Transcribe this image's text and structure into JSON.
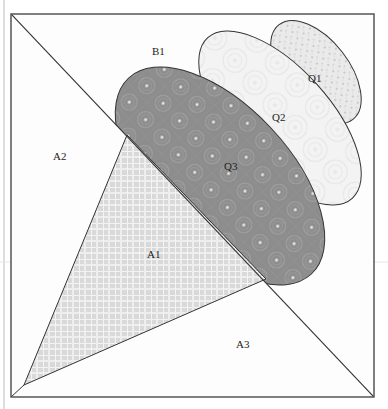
{
  "diagram": {
    "title": "",
    "colors": {
      "background": "#fdfdfd",
      "outline": "#333333",
      "frame": "#555555",
      "plaid": "#dcdcdc",
      "q3_fill": "#8f8f8f",
      "q2_fill": "#f4f4f4",
      "q1_fill": "#e4e4e4"
    },
    "pieces": [
      {
        "id": "B1",
        "label": "B1",
        "fabric": "light background"
      },
      {
        "id": "A2",
        "label": "A2",
        "fabric": "light background"
      },
      {
        "id": "A1",
        "label": "A1",
        "fabric": "light plaid"
      },
      {
        "id": "A3",
        "label": "A3",
        "fabric": "light background"
      },
      {
        "id": "Q1",
        "label": "Q1",
        "fabric": "speckled print"
      },
      {
        "id": "Q2",
        "label": "Q2",
        "fabric": "light swirl print"
      },
      {
        "id": "Q3",
        "label": "Q3",
        "fabric": "dark gray circle print"
      }
    ]
  }
}
